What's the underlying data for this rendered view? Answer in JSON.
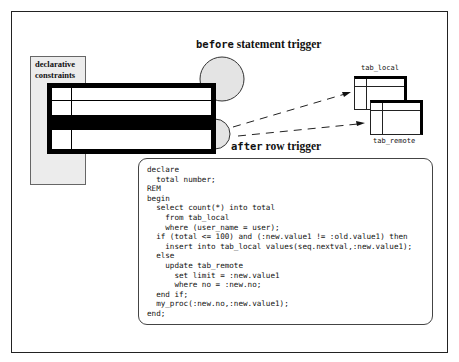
{
  "diagram": {
    "declarative_constraints": {
      "label_line1": "declarative",
      "label_line2": "constraints",
      "fill": "#ececec"
    },
    "labels": {
      "before_keyword": "before",
      "before_rest": " statement trigger",
      "after_keyword": "after",
      "after_rest": " row trigger"
    },
    "tables": {
      "tab_local": "tab_local",
      "tab_remote": "tab_remote"
    },
    "trigger_circle_fill": "#e4e4e4",
    "code_lines": [
      "declare",
      "  total number;",
      "REM",
      "begin",
      "  select count(*) into total",
      "    from tab_local",
      "    where (user_name = user);",
      "  if (total <= 100) and (:new.value1 != :old.value1) then",
      "    insert into tab_local values(seq.nextval,:new.value1);",
      "  else",
      "    update tab_remote",
      "      set limit = :new.value1",
      "      where no = :new.no;",
      "  end if;",
      "  my_proc(:new.no,:new.value1);",
      "end;"
    ]
  }
}
